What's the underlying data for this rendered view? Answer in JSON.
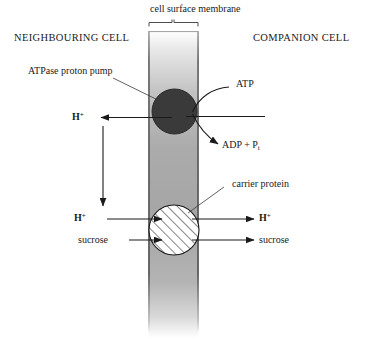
{
  "figure": {
    "title_top": "cell surface membrane",
    "left_cell_label": "NEIGHBOURING CELL",
    "right_cell_label": "COMPANION CELL",
    "membrane_color": "#a8a8a8",
    "pump_color": "#3a3a3a",
    "carrier_color": "#ffffff",
    "line_color": "#1a1a1a"
  },
  "annotations": {
    "pump_label": "ATPase proton pump",
    "atp_label": "ATP",
    "adp_label_main": "ADP + P",
    "adp_label_sub": "i",
    "carrier_label": "carrier protein"
  },
  "molecules": {
    "proton_upper_left": "H",
    "proton_upper_left_charge": "+",
    "proton_lower_left": "H",
    "proton_lower_left_charge": "+",
    "proton_lower_right": "H",
    "proton_lower_right_charge": "+",
    "sucrose_left": "sucrose",
    "sucrose_right": "sucrose"
  }
}
